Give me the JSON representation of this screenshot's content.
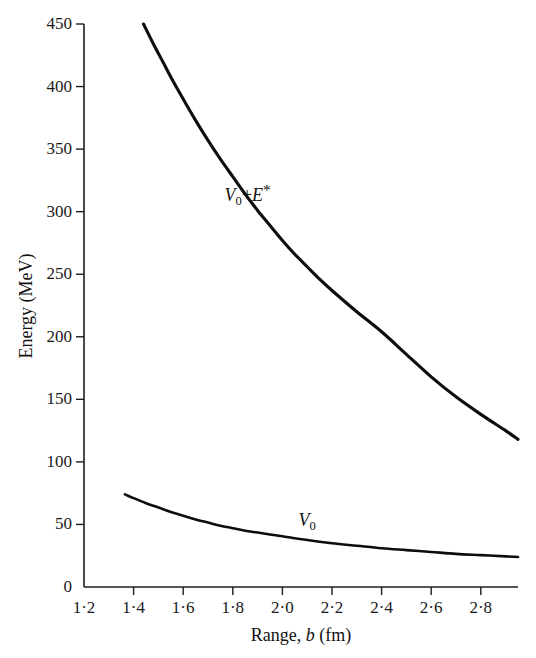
{
  "figure": {
    "background_color": "#ffffff",
    "line_color": "#0d0d0d",
    "axis_color": "#1c1c1c"
  },
  "chart_data": {
    "type": "line",
    "title": "",
    "xlabel": "Range, b (fm)",
    "ylabel": "Energy (MeV)",
    "xlabel_parts": {
      "prefix": "Range, ",
      "variable": "b",
      "suffix": " (fm)"
    },
    "xlim": [
      1.2,
      2.95
    ],
    "ylim": [
      0,
      450
    ],
    "grid": false,
    "legend": "inline-curve-labels",
    "x_ticks": [
      1.2,
      1.4,
      1.6,
      1.8,
      2.0,
      2.2,
      2.4,
      2.6,
      2.8
    ],
    "x_tick_labels": [
      "1·2",
      "1·4",
      "1·6",
      "1·8",
      "2·0",
      "2·2",
      "2·4",
      "2·6",
      "2·8"
    ],
    "y_ticks": [
      0,
      50,
      100,
      150,
      200,
      250,
      300,
      350,
      400,
      450
    ],
    "y_tick_labels": [
      "0",
      "50",
      "100",
      "150",
      "200",
      "250",
      "300",
      "350",
      "400",
      "450"
    ],
    "series": [
      {
        "name": "V0+E*",
        "label_text": "V₀+E*",
        "label_parts": {
          "v": "V",
          "v_sub": "0",
          "plus": "+",
          "e": "E",
          "e_sup": "*"
        },
        "label_x": 1.86,
        "label_y": 313,
        "x": [
          1.44,
          1.48,
          1.52,
          1.56,
          1.6,
          1.65,
          1.7,
          1.75,
          1.8,
          1.85,
          1.9,
          1.95,
          2.0,
          2.05,
          2.1,
          2.15,
          2.2,
          2.3,
          2.4,
          2.5,
          2.6,
          2.7,
          2.8,
          2.9,
          2.95
        ],
        "y": [
          450,
          434,
          419,
          404,
          390,
          373,
          357,
          342,
          328,
          314,
          301,
          289,
          277,
          266,
          256,
          246,
          237,
          220,
          204,
          186,
          168,
          152,
          138,
          125,
          118
        ]
      },
      {
        "name": "V0",
        "label_text": "V₀",
        "label_parts": {
          "v": "V",
          "v_sub": "0"
        },
        "label_x": 2.1,
        "label_y": 52,
        "x": [
          1.365,
          1.4,
          1.45,
          1.5,
          1.55,
          1.6,
          1.65,
          1.7,
          1.75,
          1.8,
          1.85,
          1.9,
          1.95,
          2.0,
          2.1,
          2.2,
          2.3,
          2.4,
          2.5,
          2.6,
          2.7,
          2.8,
          2.9,
          2.95
        ],
        "y": [
          74,
          71,
          67,
          63.5,
          60,
          57,
          54,
          51.5,
          49,
          47,
          45,
          43.5,
          42,
          40.5,
          37.5,
          35,
          33,
          31,
          29.5,
          28,
          26.5,
          25.5,
          24.5,
          24
        ]
      }
    ]
  }
}
